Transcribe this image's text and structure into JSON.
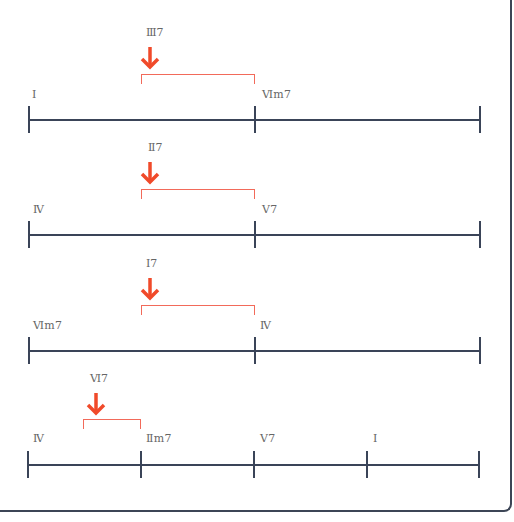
{
  "colors": {
    "line": "#3a4458",
    "accent": "#f04a2a",
    "bracket": "#f26a5a",
    "text": "#666666",
    "frame": "#3c4556"
  },
  "rows": [
    {
      "chords": [
        {
          "label": "I",
          "x": 32
        },
        {
          "label": "Ⅵm7",
          "x": 262
        }
      ],
      "ticks": [
        28,
        254,
        479
      ],
      "secondary": {
        "label": "Ⅲ7",
        "from": 141,
        "to": 254
      }
    },
    {
      "chords": [
        {
          "label": "Ⅳ",
          "x": 33
        },
        {
          "label": "Ⅴ7",
          "x": 262
        }
      ],
      "ticks": [
        28,
        254,
        479
      ],
      "secondary": {
        "label": "Ⅱ7",
        "from": 141,
        "to": 254
      }
    },
    {
      "chords": [
        {
          "label": "Ⅵm7",
          "x": 33
        },
        {
          "label": "Ⅳ",
          "x": 260
        }
      ],
      "ticks": [
        28,
        254,
        479
      ],
      "secondary": {
        "label": "Ⅰ7",
        "from": 141,
        "to": 254
      }
    },
    {
      "chords": [
        {
          "label": "Ⅳ",
          "x": 33
        },
        {
          "label": "Ⅱm7",
          "x": 146
        },
        {
          "label": "Ⅴ7",
          "x": 260
        },
        {
          "label": "I",
          "x": 373
        }
      ],
      "ticks": [
        28,
        140,
        254,
        367,
        479
      ],
      "secondary": {
        "label": "Ⅵ7",
        "from": 83,
        "to": 140
      }
    }
  ]
}
